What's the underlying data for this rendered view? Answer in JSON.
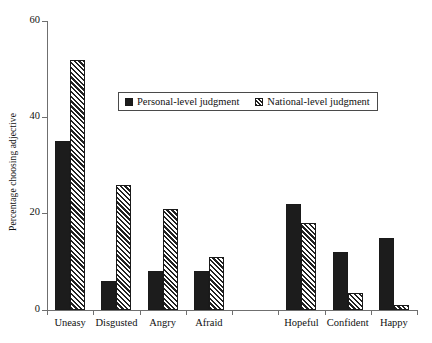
{
  "chart_data": {
    "type": "bar",
    "title": "",
    "xlabel": "",
    "ylabel": "Percentage choosing adjective",
    "ylim": [
      0,
      60
    ],
    "yticks": [
      0,
      20,
      40,
      60
    ],
    "grid": false,
    "legend_position": "upper-center",
    "categories": [
      "Uneasy",
      "Disgusted",
      "Angry",
      "Afraid",
      "",
      "Hopeful",
      "Confident",
      "Happy"
    ],
    "series": [
      {
        "name": "Personal-level judgment",
        "color": "#1c1c1c",
        "fill": "solid",
        "values": [
          35,
          6,
          8,
          8,
          null,
          22,
          12,
          15
        ]
      },
      {
        "name": "National-level judgment",
        "color": "#222222",
        "fill": "diagonal-hatch",
        "values": [
          52,
          26,
          21,
          11,
          null,
          18,
          3.5,
          1
        ]
      }
    ]
  },
  "axes": {
    "y_title": "Percentage choosing adjective",
    "y_tick_labels": [
      "60",
      "40",
      "20",
      "0"
    ],
    "x_tick_labels": [
      "Uneasy",
      "Disgusted",
      "Angry",
      "Afraid",
      "Hopeful",
      "Confident",
      "Happy"
    ]
  },
  "legend": {
    "items": [
      {
        "label": "Personal-level judgment",
        "swatch": "solid-black-square"
      },
      {
        "label": "National-level judgment",
        "swatch": "hatched-square"
      }
    ]
  }
}
